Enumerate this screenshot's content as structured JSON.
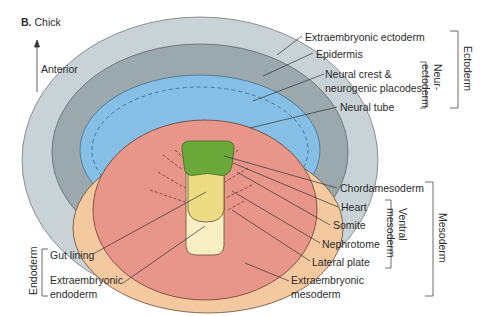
{
  "figure": {
    "panel_letter": "B.",
    "title": "Chick",
    "orientation_label": "Anterior"
  },
  "labels": {
    "extraembryonic_ectoderm": "Extraembryonic ectoderm",
    "epidermis": "Epidermis",
    "neural_crest_1": "Neural crest &",
    "neural_crest_2": "neurogenic placodes",
    "neural_tube": "Neural tube",
    "chordamesoderm": "Chordamesoderm",
    "heart": "Heart",
    "somite": "Somite",
    "nephrotome": "Nephrotome",
    "lateral_plate": "Lateral plate",
    "extraembryonic_mesoderm_1": "Extraembryonic",
    "extraembryonic_mesoderm_2": "mesoderm",
    "gut_lining": "Gut lining",
    "extraembryonic_endoderm_1": "Extraembryonic",
    "extraembryonic_endoderm_2": "endoderm"
  },
  "groups": {
    "ectoderm": "Ectoderm",
    "neurectoderm_1": "Neur-",
    "neurectoderm_2": "ectoderm",
    "mesoderm": "Mesoderm",
    "ventral_mesoderm_1": "Ventral",
    "ventral_mesoderm_2": "mesoderm",
    "endoderm": "Endoderm"
  },
  "colors": {
    "extraembryonic_ectoderm": "#c9d3d7",
    "epidermis": "#9ba8ad",
    "neural": "#86bfe6",
    "extraembryonic_mesoderm": "#f4c9a0",
    "mesoderm": "#e8968a",
    "chordamesoderm": "#6aa83a",
    "gut_lining": "#eedc84",
    "extraembryonic_endoderm": "#f7efc3"
  }
}
